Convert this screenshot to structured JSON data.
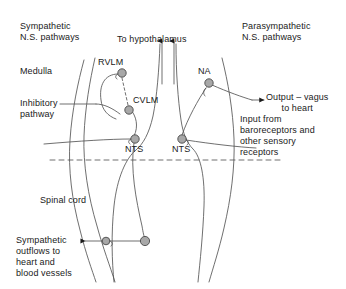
{
  "figure": {
    "type": "anatomical-schematic",
    "background_color": "#ffffff",
    "stroke_color": "#555555",
    "text_color": "#1a1a1a",
    "node_fill": "#a8a8a8",
    "node_stroke": "#4a4a4a"
  },
  "labels": {
    "sympathetic_pathways": "Sympathetic\nN.S. pathways",
    "parasympathetic_pathways": "Parasympathetic\nN.S. pathways",
    "medulla": "Medulla",
    "to_hypothalamus": "To hypothalamus",
    "inhibitory_pathway": "Inhibitory\npathway",
    "spinal_cord": "Spinal cord",
    "sympathetic_outflows": "Sympathetic\noutflows to\nheart and\nblood vessels",
    "output_vagus": "Output – vagus\nto heart",
    "input_baroreceptors": "Input from\nbaroreceptors and\nother sensory\nreceptors"
  },
  "nuclei": [
    {
      "id": "rvlm",
      "label": "RVLM",
      "x": 122,
      "y": 73,
      "label_x": 98,
      "label_y": 57
    },
    {
      "id": "cvlm",
      "label": "CVLM",
      "x": 129,
      "y": 110,
      "label_x": 133,
      "label_y": 95
    },
    {
      "id": "nts_left",
      "label": "NTS",
      "x": 135,
      "y": 139,
      "label_x": 125,
      "label_y": 142
    },
    {
      "id": "nts_right",
      "label": "NTS",
      "x": 182,
      "y": 139,
      "label_x": 172,
      "label_y": 142
    },
    {
      "id": "na",
      "label": "NA",
      "x": 209,
      "y": 83,
      "label_x": 198,
      "label_y": 66
    },
    {
      "id": "sympathetic_ganglion",
      "label": "",
      "x": 145,
      "y": 241,
      "label_x": 0,
      "label_y": 0
    },
    {
      "id": "sympathetic_outflow_node",
      "label": "",
      "x": 106,
      "y": 241,
      "label_x": 0,
      "label_y": 0
    }
  ],
  "annotations": {
    "hypothalamus_arrows": 2,
    "dashed_divider_y": 160,
    "dashed_divider_x1": 50,
    "dashed_divider_x2": 282,
    "inhibitory_is_dashed": true
  }
}
